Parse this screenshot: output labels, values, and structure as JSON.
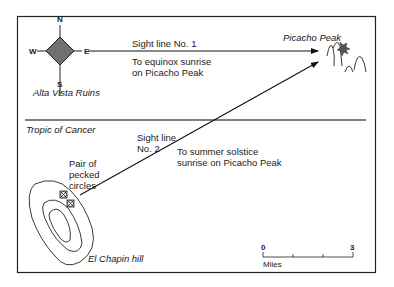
{
  "compass": {
    "north": "N",
    "south": "S",
    "east": "E",
    "west": "W",
    "fill_color": "#707070"
  },
  "locations": {
    "alta_vista": "Alta Vista Ruins",
    "picacho_peak": "Picacho Peak",
    "el_chapin": "El Chapin hill"
  },
  "sight_line_1": {
    "label": "Sight line No. 1",
    "description_line1": "To equinox sunrise",
    "description_line2": "on Picacho Peak"
  },
  "sight_line_2": {
    "label_line1": "Sight line",
    "label_line2": "No. 2",
    "description_line1": "To summer solstice",
    "description_line2": "sunrise on Picacho Peak"
  },
  "tropic": {
    "label": "Tropic of Cancer",
    "line_color": "#808080"
  },
  "pecked_circles": {
    "line1": "Pair of",
    "line2": "pecked",
    "line3": "circles"
  },
  "scale_bar": {
    "start": "0",
    "end": "3",
    "unit": "Miles"
  }
}
